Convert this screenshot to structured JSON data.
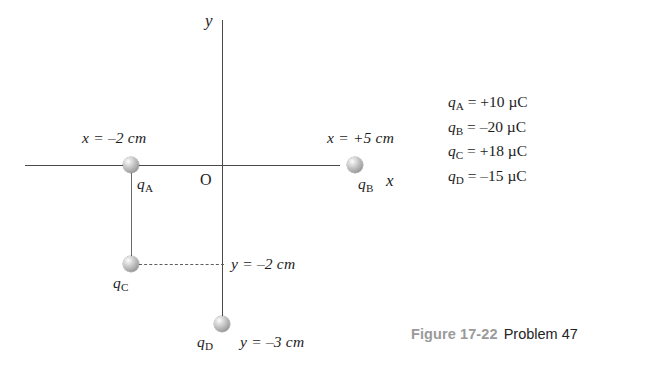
{
  "figure": {
    "caption_number": "Figure 17-22",
    "caption_problem": "Problem 47",
    "accent_gray": "#9a9a9a",
    "line_color": "#4a4a4a",
    "sphere_color": "#ababab"
  },
  "axes": {
    "x_axis_label": "x",
    "y_axis_label": "y",
    "origin_label": "O"
  },
  "charges": [
    {
      "name": "q_A",
      "symbol": "q",
      "subscript": "A",
      "position_label": "x = –2 cm",
      "value_sign": "+",
      "value": "10",
      "unit": "µC"
    },
    {
      "name": "q_B",
      "symbol": "q",
      "subscript": "B",
      "position_label": "x = +5 cm",
      "value_sign": "–",
      "value": "20",
      "unit": "µC"
    },
    {
      "name": "q_C",
      "symbol": "q",
      "subscript": "C",
      "position_label": "y = –2 cm",
      "value_sign": "+",
      "value": "18",
      "unit": "µC"
    },
    {
      "name": "q_D",
      "symbol": "q",
      "subscript": "D",
      "position_label": "y = –3 cm",
      "value_sign": "–",
      "value": "15",
      "unit": "µC"
    }
  ],
  "labels": {
    "qa_symbol": "q",
    "qa_sub": "A",
    "qb_symbol": "q",
    "qb_sub": "B",
    "qc_symbol": "q",
    "qc_sub": "C",
    "qd_symbol": "q",
    "qd_sub": "D",
    "pos_a": "x = –2 cm",
    "pos_b": "x = +5 cm",
    "pos_c": "y = –2 cm",
    "pos_d": "y = –3 cm"
  },
  "legend": [
    {
      "symbol": "q",
      "sub": "A",
      "rest": " = +10 µC"
    },
    {
      "symbol": "q",
      "sub": "B",
      "rest": " = –20 µC"
    },
    {
      "symbol": "q",
      "sub": "C",
      "rest": " = +18 µC"
    },
    {
      "symbol": "q",
      "sub": "D",
      "rest": " = –15 µC"
    }
  ]
}
